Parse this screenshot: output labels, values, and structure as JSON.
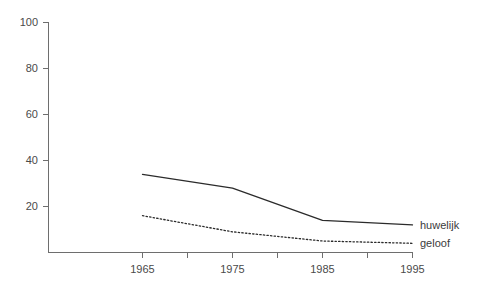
{
  "chart_data": {
    "type": "line",
    "title": "",
    "subtitle": "",
    "xlabel": "",
    "ylabel": "",
    "xlim": [
      1965,
      1995
    ],
    "ylim": [
      0,
      100
    ],
    "grid": false,
    "legend_position": "inline-right",
    "x": [
      1965,
      1975,
      1985,
      1995
    ],
    "x_tick_labels": [
      "1965",
      "1975",
      "1985",
      "1995"
    ],
    "x_minor_ticks": [
      1970,
      1980,
      1990
    ],
    "y_ticks": [
      20,
      40,
      60,
      80,
      100
    ],
    "y_tick_labels": [
      "20",
      "40",
      "60",
      "80",
      "100"
    ],
    "series": [
      {
        "name": "huwelijk",
        "style": "solid",
        "color": "#2b2b2b",
        "values": [
          34,
          28,
          14,
          12
        ]
      },
      {
        "name": "geloof",
        "style": "dotted",
        "color": "#2b2b2b",
        "values": [
          16,
          9,
          5,
          4
        ]
      }
    ]
  },
  "axes": {
    "y_label_100": "100",
    "y_label_80": "80",
    "y_label_60": "60",
    "y_label_40": "40",
    "y_label_20": "20",
    "x_label_1965": "1965",
    "x_label_1975": "1975",
    "x_label_1985": "1985",
    "x_label_1995": "1995"
  },
  "legend": {
    "series_1_label": "huwelijk",
    "series_2_label": "geloof"
  }
}
